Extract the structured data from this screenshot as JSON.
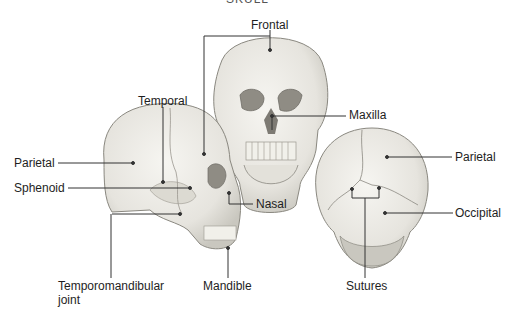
{
  "title": "SKULL",
  "labels": {
    "frontal": "Frontal",
    "temporal": "Temporal",
    "parietal_left": "Parietal",
    "sphenoid": "Sphenoid",
    "maxilla": "Maxilla",
    "nasal": "Nasal",
    "parietal_right": "Parietal",
    "occipital": "Occipital",
    "tmj_line1": "Temporomandibular",
    "tmj_line2": "joint",
    "mandible": "Mandible",
    "sutures": "Sutures"
  },
  "views": [
    "lateral-view",
    "anterior-view",
    "posterior-view"
  ],
  "colors": {
    "bone": "#ecebe6",
    "bone_shadow": "#c9c7bf",
    "outline": "#8a8880",
    "leader": "#333333"
  }
}
